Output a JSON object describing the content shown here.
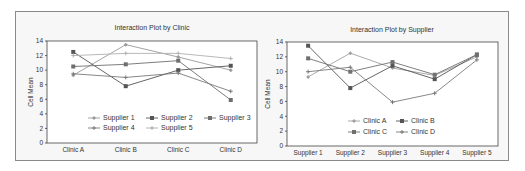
{
  "chart_data": [
    {
      "type": "line",
      "title": "Interaction Plot by Clinic",
      "xlabel": "",
      "ylabel": "Cell Mean",
      "ylim": [
        0,
        14
      ],
      "yticks": [
        0,
        2,
        4,
        6,
        8,
        10,
        12,
        14
      ],
      "categories": [
        "Clinic A",
        "Clinic B",
        "Clinic C",
        "Clinic D"
      ],
      "grid": false,
      "legend_position": "inside-bottom",
      "series": [
        {
          "name": "Supplier 1",
          "values": [
            9.3,
            13.5,
            11.8,
            10.0
          ],
          "color": "#9a9a9a",
          "marker": "diamond"
        },
        {
          "name": "Supplier 2",
          "values": [
            12.5,
            7.8,
            10.0,
            10.6
          ],
          "color": "#555555",
          "marker": "square"
        },
        {
          "name": "Supplier 3",
          "values": [
            10.5,
            10.8,
            11.3,
            5.9
          ],
          "color": "#6e6e6e",
          "marker": "square"
        },
        {
          "name": "Supplier 4",
          "values": [
            9.5,
            9.0,
            9.6,
            7.1
          ],
          "color": "#7a7a7a",
          "marker": "star"
        },
        {
          "name": "Supplier 5",
          "values": [
            12.0,
            12.3,
            12.3,
            11.6
          ],
          "color": "#b0b0b0",
          "marker": "star"
        }
      ]
    },
    {
      "type": "line",
      "title": "Interaction Plot by Supplier",
      "xlabel": "",
      "ylabel": "Cell Mean",
      "ylim": [
        0,
        14
      ],
      "yticks": [
        0,
        2,
        4,
        6,
        8,
        10,
        12,
        14
      ],
      "categories": [
        "Supplier 1",
        "Supplier 2",
        "Supplier 3",
        "Supplier 4",
        "Supplier 5"
      ],
      "grid": false,
      "legend_position": "inside-bottom",
      "series": [
        {
          "name": "Clinic A",
          "values": [
            9.3,
            12.5,
            10.5,
            9.5,
            12.0
          ],
          "color": "#a0a0a0",
          "marker": "diamond"
        },
        {
          "name": "Clinic B",
          "values": [
            13.5,
            7.8,
            10.8,
            9.0,
            12.3
          ],
          "color": "#555555",
          "marker": "square"
        },
        {
          "name": "Clinic C",
          "values": [
            11.8,
            10.0,
            11.3,
            9.6,
            12.3
          ],
          "color": "#707070",
          "marker": "square"
        },
        {
          "name": "Clinic D",
          "values": [
            10.0,
            10.6,
            5.9,
            7.1,
            11.6
          ],
          "color": "#7a7a7a",
          "marker": "star"
        }
      ]
    }
  ]
}
